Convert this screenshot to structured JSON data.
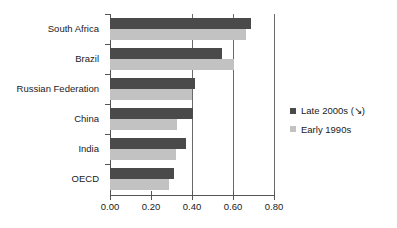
{
  "chart_data": {
    "type": "bar",
    "orientation": "horizontal",
    "title": "",
    "xlabel": "",
    "ylabel": "",
    "xlim": [
      0.0,
      0.8
    ],
    "xticks": [
      0.0,
      0.2,
      0.4,
      0.6,
      0.8
    ],
    "xtick_labels": [
      "0.00",
      "0.20",
      "0.40",
      "0.60",
      "0.80"
    ],
    "grid": "vertical gridlines at 0.40, 0.60 and 0.80",
    "legend_position": "right",
    "categories": [
      "South Africa",
      "Brazil",
      "Russian Federation",
      "China",
      "India",
      "OECD"
    ],
    "series": [
      {
        "name": "Late 2000s (↘)",
        "color": "#4a4a4a",
        "values": [
          0.69,
          0.545,
          0.415,
          0.405,
          0.37,
          0.31
        ]
      },
      {
        "name": "Early 1990s",
        "color": "#c2c2c2",
        "values": [
          0.665,
          0.605,
          0.4,
          0.325,
          0.32,
          0.29
        ]
      }
    ]
  },
  "legend": {
    "items": [
      {
        "label": "Late 2000s (↘)",
        "color": "#4a4a4a"
      },
      {
        "label": "Early 1990s",
        "color": "#c2c2c2"
      }
    ]
  },
  "axis": {
    "tick_labels": [
      "0.00",
      "0.20",
      "0.40",
      "0.60",
      "0.80"
    ]
  },
  "colors": {
    "late": "#4a4a4a",
    "early": "#c2c2c2",
    "axis": "#555555",
    "grid": "#6a6a6a",
    "text": "#1a1a1a",
    "background": "#ffffff"
  }
}
